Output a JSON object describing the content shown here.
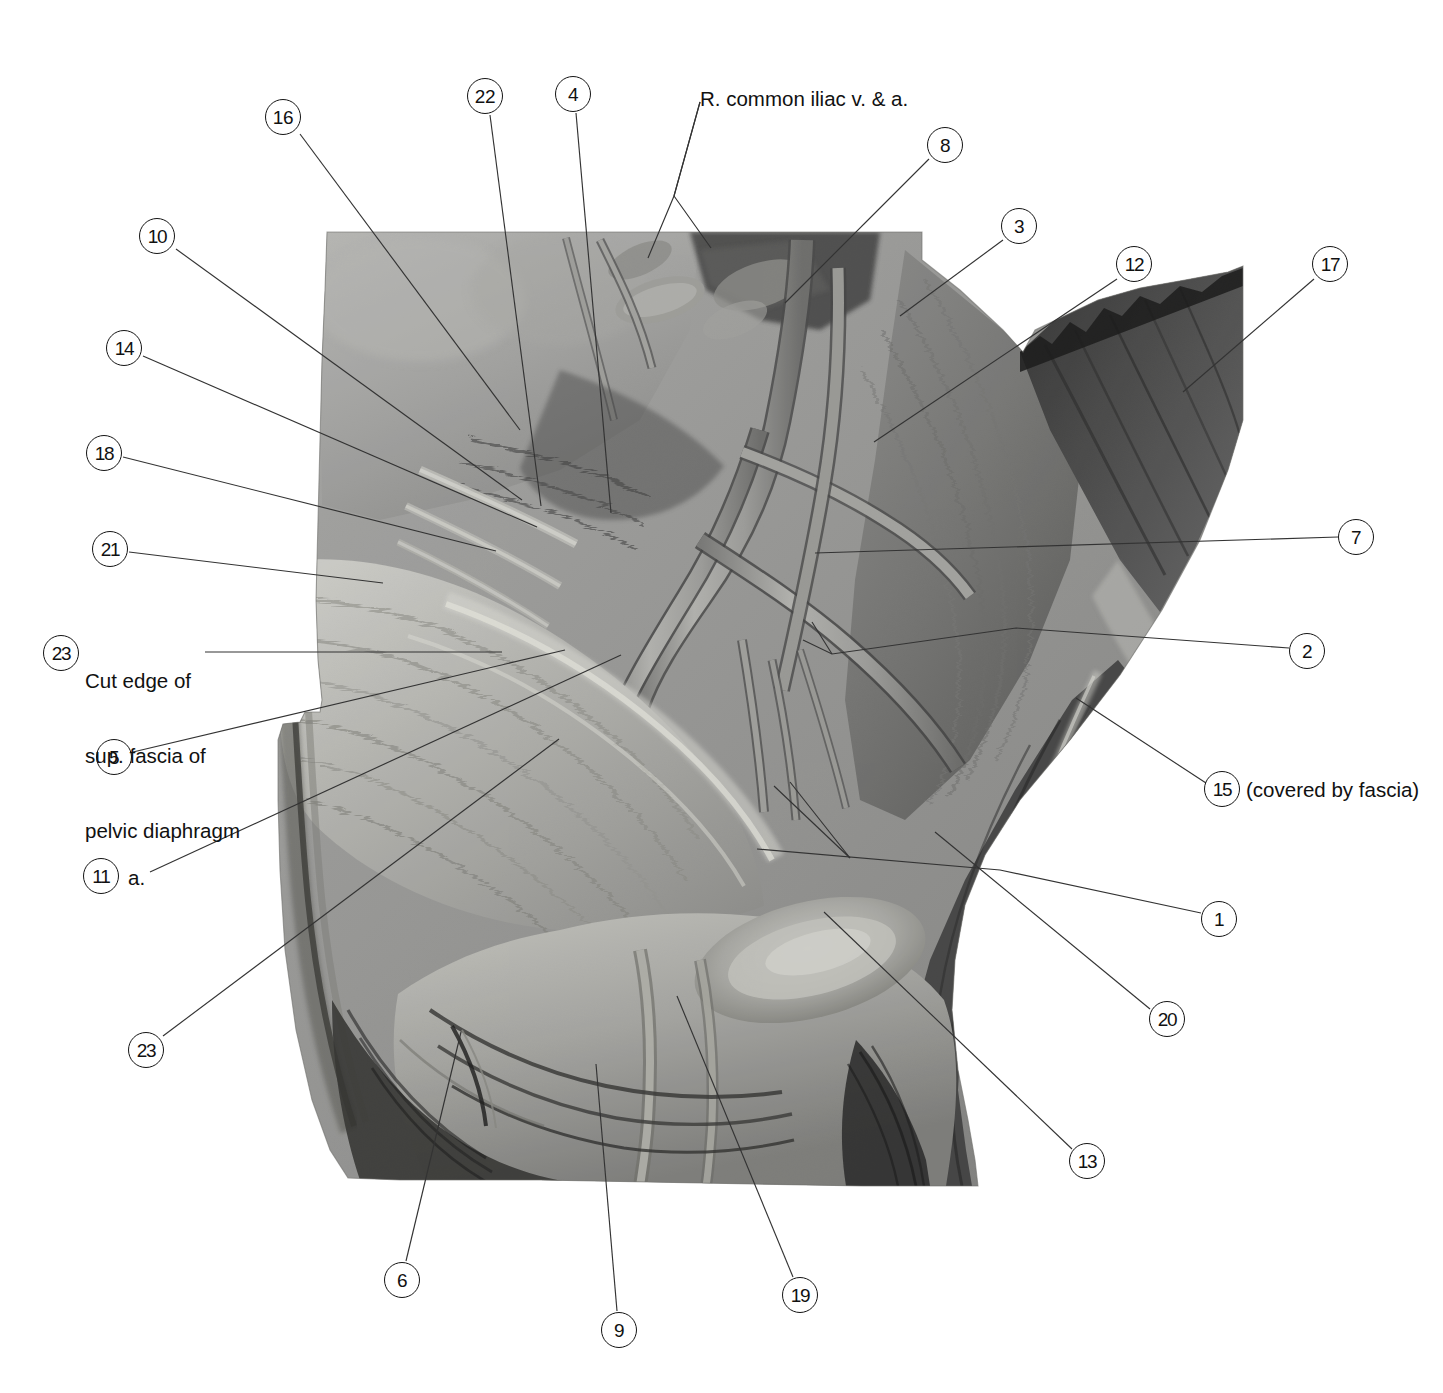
{
  "plate": {
    "width": 1443,
    "height": 1393,
    "background": "#ffffff",
    "kind": "anatomical-photograph-plate",
    "region": "right hemipelvis, medial view",
    "ink_color": "#111111",
    "leader_color": "#333333"
  },
  "photo": {
    "name": "pelvic-dissection-photograph",
    "tone": "grayscale",
    "bounds": {
      "left": 277,
      "top": 232,
      "right": 1243,
      "bottom": 1186
    }
  },
  "callouts": [
    {
      "id": "16",
      "label": "16",
      "cx": 283,
      "cy": 117,
      "tip_x": 520,
      "tip_y": 430
    },
    {
      "id": "22",
      "label": "22",
      "cx": 485,
      "cy": 96,
      "tip_x": 541,
      "tip_y": 506
    },
    {
      "id": "4",
      "label": "4",
      "cx": 573,
      "cy": 94,
      "tip_x": 611,
      "tip_y": 513
    },
    {
      "id": "8",
      "label": "8",
      "cx": 945,
      "cy": 145,
      "tip_x": 785,
      "tip_y": 303
    },
    {
      "id": "3",
      "label": "3",
      "cx": 1019,
      "cy": 226,
      "tip_x": 900,
      "tip_y": 316
    },
    {
      "id": "12",
      "label": "12",
      "cx": 1134,
      "cy": 264,
      "tip_x": 874,
      "tip_y": 442
    },
    {
      "id": "17",
      "label": "17",
      "cx": 1330,
      "cy": 264,
      "tip_x": 1183,
      "tip_y": 392
    },
    {
      "id": "10",
      "label": "10",
      "cx": 157,
      "cy": 236,
      "tip_x": 522,
      "tip_y": 500
    },
    {
      "id": "14",
      "label": "14",
      "cx": 124,
      "cy": 348,
      "tip_x": 537,
      "tip_y": 527
    },
    {
      "id": "18",
      "label": "18",
      "cx": 104,
      "cy": 453,
      "tip_x": 496,
      "tip_y": 551
    },
    {
      "id": "21",
      "label": "21",
      "cx": 110,
      "cy": 549,
      "tip_x": 383,
      "tip_y": 583
    },
    {
      "id": "23",
      "label": "23",
      "cx": 61,
      "cy": 653,
      "tip_x": 502,
      "tip_y": 652
    },
    {
      "id": "5",
      "label": "5",
      "cx": 114,
      "cy": 757,
      "tip_x": 565,
      "tip_y": 650
    },
    {
      "id": "7",
      "label": "7",
      "cx": 1356,
      "cy": 537,
      "tip_x": 815,
      "tip_y": 553
    },
    {
      "id": "2",
      "label": "2",
      "cx": 1307,
      "cy": 651,
      "tip_x": 803,
      "tip_y": 640
    },
    {
      "id": "15",
      "label": "15",
      "cx": 1222,
      "cy": 789,
      "tip_x": 1076,
      "tip_y": 698
    },
    {
      "id": "11",
      "label": "11",
      "cx": 101,
      "cy": 876,
      "tip_x": 621,
      "tip_y": 655
    },
    {
      "id": "1",
      "label": "1",
      "cx": 1219,
      "cy": 919,
      "tip_x": 757,
      "tip_y": 849
    },
    {
      "id": "20",
      "label": "20",
      "cx": 1167,
      "cy": 1019,
      "tip_x": 935,
      "tip_y": 832
    },
    {
      "id": "13",
      "label": "13",
      "cx": 1087,
      "cy": 1161,
      "tip_x": 824,
      "tip_y": 912
    },
    {
      "id": "23b",
      "label": "23",
      "cx": 146,
      "cy": 1050,
      "tip_x": 559,
      "tip_y": 739
    },
    {
      "id": "6",
      "label": "6",
      "cx": 402,
      "cy": 1280,
      "tip_x": 461,
      "tip_y": 1032
    },
    {
      "id": "9",
      "label": "9",
      "cx": 619,
      "cy": 1330,
      "tip_x": 596,
      "tip_y": 1064
    },
    {
      "id": "19",
      "label": "19",
      "cx": 800,
      "cy": 1295,
      "tip_x": 677,
      "tip_y": 996
    }
  ],
  "text_labels": [
    {
      "name": "r-common-iliac-label",
      "text": "R. common iliac v. & a.",
      "x": 700,
      "y": 86,
      "fork": {
        "x": 674,
        "y": 196
      },
      "tips": [
        {
          "x": 648,
          "y": 258
        },
        {
          "x": 711,
          "y": 248
        }
      ]
    },
    {
      "name": "cut-edge-label",
      "line1": "Cut edge of",
      "line2": "sup. fascia of",
      "line3": "pelvic diaphragm",
      "x": 85,
      "y": 618
    },
    {
      "name": "label-11-suffix",
      "text": "a.",
      "x": 128,
      "y": 866
    },
    {
      "name": "label-15-suffix",
      "text": "(covered by fascia)",
      "x": 1246,
      "y": 778
    }
  ]
}
